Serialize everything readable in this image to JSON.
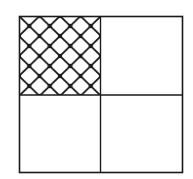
{
  "diagram": {
    "type": "square-divided-into-quarters",
    "grid": {
      "rows": 2,
      "cols": 2
    },
    "shaded_quadrant": "top-left",
    "shading_pattern": "diagonal-crosshatch",
    "shaded_fraction": "1/4",
    "colors": {
      "stroke": "#1a1a1a",
      "background": "#ffffff"
    }
  }
}
